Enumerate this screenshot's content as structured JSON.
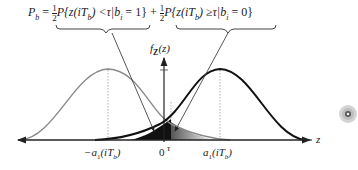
{
  "formula": {
    "lhs": "P",
    "lhs_sub": "b",
    "eq": "=",
    "half": "1",
    "half_den": "2",
    "term1": "P{z(iT",
    "term1_sub": "b",
    "term1_rest": ") <τ|b",
    "term1_i": "i",
    "term1_end": " = 1}",
    "plus": "+",
    "term2": "P{z(iT",
    "term2_sub": "b",
    "term2_rest": ") ≥τ|b",
    "term2_i": "i",
    "term2_end": " = 0}"
  },
  "axis": {
    "y_label": "f",
    "y_label_sub": "Z",
    "y_label_arg": "(z)",
    "x_label": "z"
  },
  "ticks": {
    "left_mean": "−a",
    "left_sub": "1",
    "left_arg": "(iT",
    "left_arg_sub": "b",
    "left_close": ")",
    "zero": "0",
    "tau": "τ",
    "right_mean": "a",
    "right_sub": "1",
    "right_arg": "(iT",
    "right_arg_sub": "b",
    "right_close": ")"
  },
  "colors": {
    "left_curve": "#8a8a8a",
    "right_curve": "#111111",
    "axis": "#222222"
  },
  "side_icon": "disc-icon"
}
